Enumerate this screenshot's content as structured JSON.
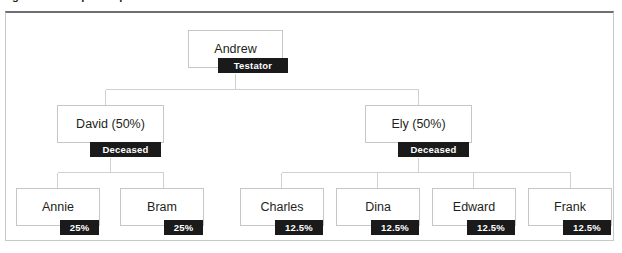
{
  "caption": {
    "text": "Figure 6.1   The per stirpes distribution of an estate"
  },
  "diagram": {
    "colors": {
      "box_border": "#c5c6c8",
      "badge_background": "#1a1a1a",
      "badge_text": "#ffffff",
      "panel_border": "#c9c9c9",
      "panel_top_border": "#6d6e71",
      "text": "#231f20",
      "connector": "#d0d0d0"
    },
    "levels": [
      {
        "level": 1,
        "nodes": [
          {
            "id": "andrew",
            "label": "Andrew",
            "badge": "Testator"
          }
        ]
      },
      {
        "level": 2,
        "nodes": [
          {
            "id": "david",
            "label": "David (50%)",
            "badge": "Deceased"
          },
          {
            "id": "ely",
            "label": "Ely (50%)",
            "badge": "Deceased"
          }
        ]
      },
      {
        "level": 3,
        "nodes": [
          {
            "id": "annie",
            "label": "Annie",
            "badge": "25%",
            "parent": "david"
          },
          {
            "id": "bram",
            "label": "Bram",
            "badge": "25%",
            "parent": "david"
          },
          {
            "id": "charles",
            "label": "Charles",
            "badge": "12.5%",
            "parent": "ely"
          },
          {
            "id": "dina",
            "label": "Dina",
            "badge": "12.5%",
            "parent": "ely"
          },
          {
            "id": "edward",
            "label": "Edward",
            "badge": "12.5%",
            "parent": "ely"
          },
          {
            "id": "frank",
            "label": "Frank",
            "badge": "12.5%",
            "parent": "ely"
          }
        ]
      }
    ]
  }
}
